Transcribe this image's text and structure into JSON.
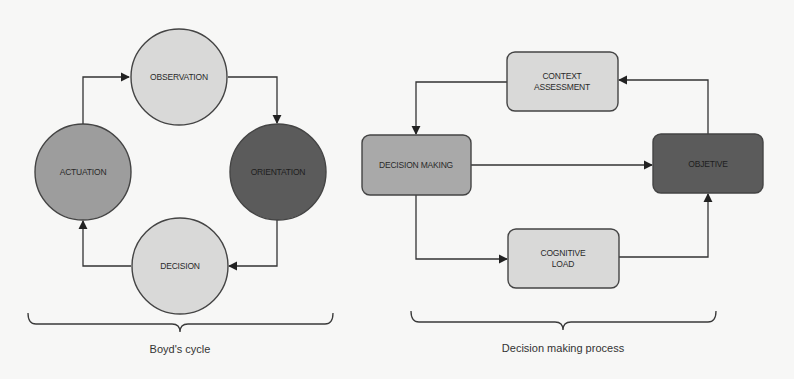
{
  "colors": {
    "background": "#f7f7f6",
    "light": "#d9d9d8",
    "mid": "#9d9d9d",
    "mid_light": "#a9a9a9",
    "dark": "#5b5b5b",
    "stroke": "#444444",
    "edge": "#333333"
  },
  "boyds_cycle": {
    "label": "Boyd's cycle",
    "nodes": {
      "observation": {
        "label": "OBSERVATION",
        "shape": "circle",
        "fill": "light"
      },
      "orientation": {
        "label": "ORIENTATION",
        "shape": "circle",
        "fill": "dark"
      },
      "decision": {
        "label": "DECISION",
        "shape": "circle",
        "fill": "light"
      },
      "actuation": {
        "label": "ACTUATION",
        "shape": "circle",
        "fill": "mid"
      }
    },
    "edges": [
      {
        "from": "actuation",
        "to": "observation"
      },
      {
        "from": "observation",
        "to": "orientation"
      },
      {
        "from": "orientation",
        "to": "decision"
      },
      {
        "from": "decision",
        "to": "actuation"
      }
    ]
  },
  "decision_making_process": {
    "label": "Decision making process",
    "nodes": {
      "context_assessment": {
        "label_line1": "CONTEXT",
        "label_line2": "ASSESSMENT",
        "shape": "rounded-rect",
        "fill": "light"
      },
      "decision_making": {
        "label": "DECISION MAKING",
        "shape": "rounded-rect",
        "fill": "mid_light"
      },
      "objective": {
        "label": "OBJETIVE",
        "shape": "rounded-rect",
        "fill": "dark"
      },
      "cognitive_load": {
        "label_line1": "COGNITIVE",
        "label_line2": "LOAD",
        "shape": "rounded-rect",
        "fill": "light"
      }
    },
    "edges": [
      {
        "from": "context_assessment",
        "to": "decision_making"
      },
      {
        "from": "decision_making",
        "to": "objective"
      },
      {
        "from": "decision_making",
        "to": "cognitive_load"
      },
      {
        "from": "cognitive_load",
        "to": "objective"
      },
      {
        "from": "objective",
        "to": "context_assessment"
      }
    ]
  }
}
